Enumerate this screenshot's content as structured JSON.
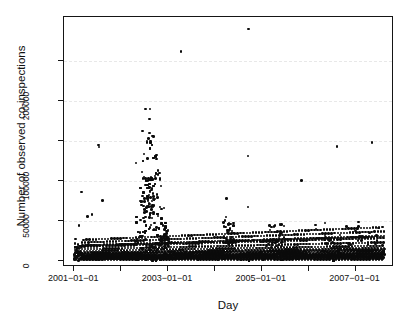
{
  "chart_data": {
    "type": "scatter",
    "title": "",
    "xlabel": "Day",
    "ylabel": "Number of observed co-inspections",
    "x_tick_labels": [
      "2001-01-01",
      "",
      "2003-01-01",
      "",
      "2005-01-01",
      "",
      "2007-01-01"
    ],
    "x_tick_values": [
      2001.0,
      2002.0,
      2003.0,
      2004.0,
      2005.0,
      2006.0,
      2007.0
    ],
    "xlim": [
      2000.78,
      2007.82
    ],
    "y_tick_labels": [
      "0",
      "50000",
      "100000",
      "",
      "200000",
      ""
    ],
    "y_tick_values": [
      0,
      50000,
      100000,
      150000,
      200000,
      250000
    ],
    "ylim": [
      -8000,
      305000
    ],
    "grid": "horizontal-dashed-light",
    "grid_values": [
      50000,
      100000,
      150000,
      200000,
      250000
    ],
    "grid_color": "#e8e8e8",
    "point_color": "#0b0b0b",
    "point_size": 2.6,
    "legend": "none",
    "n_points_approx": 2500,
    "annotations": [
      {
        "label": "mid-2002 burst",
        "x": 2002.55,
        "y": 190000
      },
      {
        "label": "late-2004 extreme outlier",
        "x": 2004.72,
        "y": 290000
      },
      {
        "label": "early-2003 outlier",
        "x": 2003.28,
        "y": 262000
      }
    ],
    "notable_points": [
      {
        "x": 2004.72,
        "y": 290000
      },
      {
        "x": 2003.28,
        "y": 262000
      },
      {
        "x": 2002.52,
        "y": 190000
      },
      {
        "x": 2002.62,
        "y": 190000
      },
      {
        "x": 2002.6,
        "y": 177000
      },
      {
        "x": 2002.45,
        "y": 162000
      },
      {
        "x": 2002.55,
        "y": 148000
      },
      {
        "x": 2002.63,
        "y": 150000
      },
      {
        "x": 2001.52,
        "y": 145000
      },
      {
        "x": 2001.53,
        "y": 142000
      },
      {
        "x": 2007.35,
        "y": 148000
      },
      {
        "x": 2006.6,
        "y": 143000
      },
      {
        "x": 2002.75,
        "y": 132000
      },
      {
        "x": 2002.32,
        "y": 122000
      },
      {
        "x": 2004.7,
        "y": 131000
      },
      {
        "x": 2002.78,
        "y": 108000
      },
      {
        "x": 2005.85,
        "y": 100000
      },
      {
        "x": 2001.15,
        "y": 86000
      },
      {
        "x": 2001.6,
        "y": 75000
      },
      {
        "x": 2004.25,
        "y": 78000
      },
      {
        "x": 2004.7,
        "y": 67000
      },
      {
        "x": 2001.38,
        "y": 58000
      },
      {
        "x": 2001.28,
        "y": 55000
      },
      {
        "x": 2001.1,
        "y": 44000
      }
    ],
    "series": [
      {
        "name": "co-inspections",
        "points_note": "full daily series; rendered procedurally from the statistical envelope described below",
        "envelope": {
          "baseline_median": 6000,
          "baseline_upper_2001": 18000,
          "baseline_upper_2004": 26000,
          "baseline_upper_2007": 30000,
          "burst_window": [
            2002.3,
            2002.95
          ],
          "burst_peak": 190000
        }
      }
    ]
  },
  "axis_titles": {
    "x": "Day",
    "y": "Number of observed co-inspections"
  }
}
